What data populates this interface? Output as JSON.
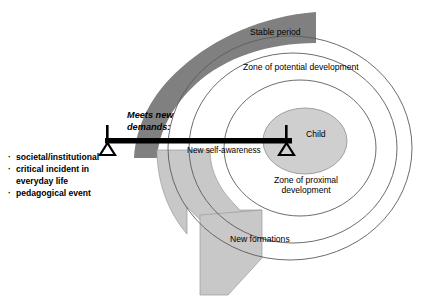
{
  "figure": {
    "title_alt": "Developmental zones diagram",
    "colors": {
      "stable_band": "#808080",
      "new_formations_arrow": "#c8c8c8",
      "child_ellipse": "#cfcfcf",
      "outline": "#595959",
      "beam": "#000000",
      "text": "#000000",
      "background": "#ffffff"
    }
  },
  "zones": {
    "outer_label": "Zone of potential development",
    "inner_label_line1": "Zone of proximal",
    "inner_label_line2": "development",
    "core_label": "Child"
  },
  "bands": {
    "stable_period": "Stable period",
    "new_formations": "New formations"
  },
  "beam": {
    "demands_line1": "Meets new",
    "demands_line2": "demands:",
    "self_awareness": "New self-awareness"
  },
  "demands_list": {
    "bullet_glyph": "·",
    "items": [
      "societal/institutional",
      "critical incident in",
      "everyday life",
      "pedagogical event"
    ],
    "items_display": [
      {
        "bullet": true,
        "text": "societal/institutional"
      },
      {
        "bullet": true,
        "text": "critical incident in"
      },
      {
        "bullet": false,
        "text": "everyday life"
      },
      {
        "bullet": true,
        "text": "pedagogical event"
      }
    ]
  }
}
